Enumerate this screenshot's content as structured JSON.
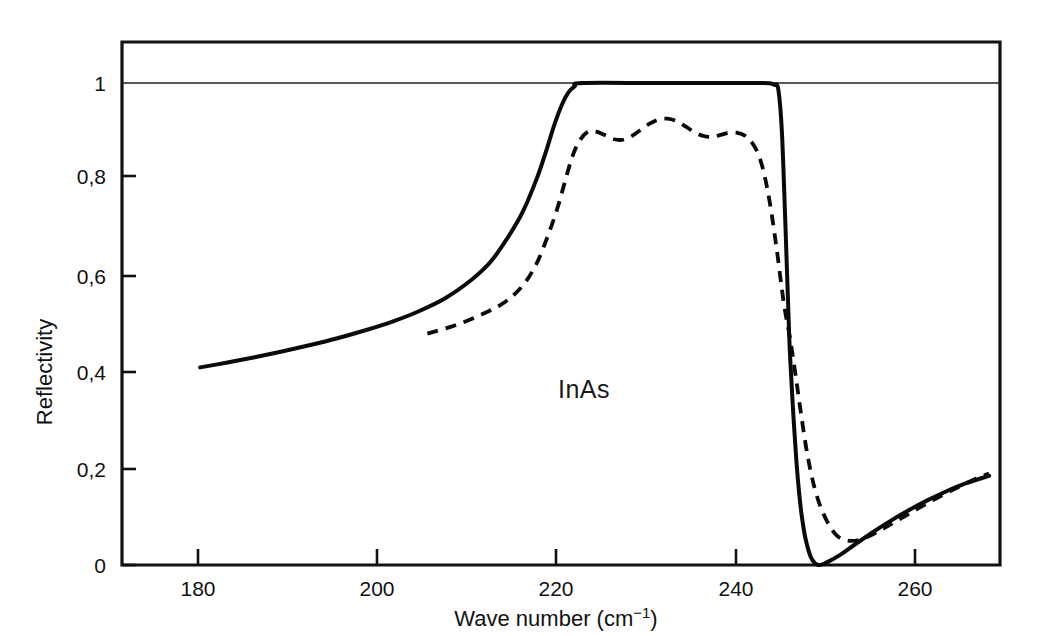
{
  "chart_data": {
    "type": "line",
    "title": "",
    "xlabel": "Wave number (cm⁻¹)",
    "ylabel": "Reflectivity",
    "annotation": "InAs",
    "xlim": [
      171.4,
      268.0
    ],
    "ylim": [
      0,
      1.085
    ],
    "grid": false,
    "legend_position": "none",
    "xticks": [
      180,
      200,
      220,
      240,
      260
    ],
    "xtick_labels": [
      "180",
      "200",
      "220",
      "240",
      "260"
    ],
    "yticks": [
      0,
      0.2,
      0.4,
      0.6,
      0.8,
      1
    ],
    "ytick_labels": [
      "0",
      "0,2",
      "0,4",
      "0,6",
      "0,8",
      "1"
    ],
    "gridline_at_y": 1.0,
    "series": [
      {
        "name": "solid-curve",
        "style": "solid",
        "x": [
          180.0,
          183.0,
          186.0,
          189.0,
          192.0,
          195.0,
          198.0,
          201.0,
          204.0,
          207.0,
          210.0,
          212.0,
          214.0,
          215.5,
          217.0,
          218.0,
          219.0,
          219.8,
          220.5,
          221.2,
          222.0,
          230.0,
          238.0,
          242.0,
          242.8,
          243.2,
          243.6,
          244.0,
          244.4,
          244.8,
          245.0,
          245.3,
          245.6,
          245.9,
          246.2,
          246.6,
          247.2,
          248.0,
          249.0,
          250.5,
          252.0,
          254.0,
          256.0,
          258.0,
          260.0,
          262.0,
          264.0,
          266.8
        ],
        "y": [
          0.41,
          0.42,
          0.431,
          0.443,
          0.456,
          0.47,
          0.486,
          0.504,
          0.526,
          0.554,
          0.594,
          0.63,
          0.684,
          0.733,
          0.8,
          0.855,
          0.915,
          0.955,
          0.98,
          0.993,
          1.0,
          1.0,
          1.0,
          1.0,
          0.999,
          0.996,
          0.988,
          0.9,
          0.7,
          0.48,
          0.4,
          0.3,
          0.215,
          0.15,
          0.1,
          0.055,
          0.016,
          0.0,
          0.006,
          0.022,
          0.042,
          0.068,
          0.092,
          0.114,
          0.134,
          0.152,
          0.168,
          0.185
        ]
      },
      {
        "name": "dashed-curve",
        "style": "dashed",
        "x": [
          205.0,
          208.0,
          211.0,
          213.5,
          215.5,
          217.0,
          218.2,
          219.3,
          220.2,
          221.0,
          221.8,
          222.6,
          223.4,
          224.4,
          225.4,
          226.4,
          227.4,
          228.4,
          229.4,
          230.4,
          231.4,
          232.4,
          233.4,
          234.4,
          235.4,
          236.2,
          237.0,
          238.0,
          239.0,
          240.0,
          241.0,
          241.8,
          242.6,
          243.4,
          244.2,
          244.9,
          245.5,
          246.1,
          246.8,
          247.6,
          248.6,
          250.0,
          251.6,
          253.4,
          255.4,
          257.6,
          260.0,
          262.4,
          265.0,
          266.8
        ],
        "y": [
          0.48,
          0.497,
          0.52,
          0.545,
          0.58,
          0.625,
          0.68,
          0.74,
          0.8,
          0.85,
          0.882,
          0.898,
          0.9,
          0.893,
          0.884,
          0.882,
          0.889,
          0.902,
          0.915,
          0.924,
          0.926,
          0.921,
          0.91,
          0.898,
          0.89,
          0.888,
          0.891,
          0.896,
          0.897,
          0.89,
          0.868,
          0.83,
          0.76,
          0.66,
          0.545,
          0.47,
          0.395,
          0.315,
          0.23,
          0.16,
          0.105,
          0.062,
          0.05,
          0.058,
          0.078,
          0.102,
          0.128,
          0.152,
          0.176,
          0.19
        ]
      }
    ]
  },
  "axis": {
    "ylabel": "Reflectivity",
    "xlabel": "Wave number (cm⁻¹)",
    "xlabel_main": "Wave number (cm",
    "xlabel_sup": "−1",
    "xlabel_close": ")",
    "annotation": "InAs"
  },
  "colors": {
    "curve": "#0a0a0a",
    "frame": "#111111",
    "background": "#ffffff"
  }
}
